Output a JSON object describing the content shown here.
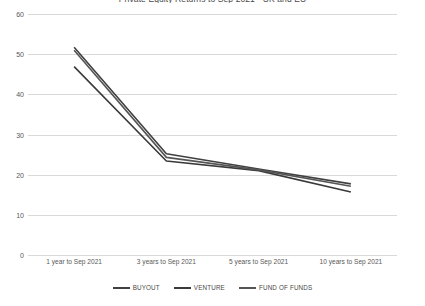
{
  "chart_data": {
    "type": "line",
    "title": "Private Equity Returns to Sep 2021 - UK and EU",
    "xlabel": "",
    "ylabel": "",
    "ylim": [
      0,
      60
    ],
    "yticks": [
      0,
      10,
      20,
      30,
      40,
      50,
      60
    ],
    "grid": true,
    "legend_position": "bottom",
    "categories": [
      "1 year to Sep 2021",
      "3 years to Sep 2021",
      "5 years to Sep 2021",
      "10 years to Sep 2021"
    ],
    "series": [
      {
        "name": "BUYOUT",
        "color": "#404040",
        "values": [
          51.7,
          25.2,
          21.4,
          17.7
        ]
      },
      {
        "name": "VENTURE",
        "color": "#3a3a3a",
        "values": [
          46.9,
          23.4,
          21.0,
          15.7
        ]
      },
      {
        "name": "FUND OF FUNDS",
        "color": "#555555",
        "values": [
          51.0,
          24.3,
          21.2,
          17.1
        ]
      }
    ]
  },
  "axis": {
    "y_labels": [
      "60",
      "50",
      "40",
      "30",
      "20",
      "10",
      "0"
    ]
  }
}
